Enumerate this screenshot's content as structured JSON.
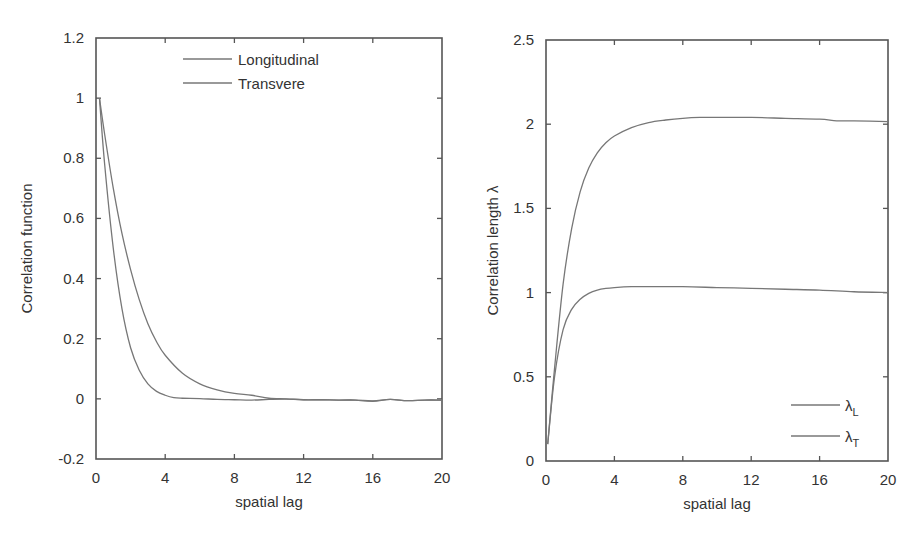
{
  "chart_data": [
    {
      "type": "line",
      "id": "left",
      "title": "",
      "xlabel": "spatial lag",
      "ylabel": "Correlation function",
      "xlim": [
        0,
        20
      ],
      "ylim": [
        -0.2,
        1.2
      ],
      "xticks": [
        0,
        4,
        8,
        12,
        16,
        20
      ],
      "yticks": [
        -0.2,
        0,
        0.2,
        0.4,
        0.6,
        0.8,
        1,
        1.2
      ],
      "ytick_labels": [
        "-0.2",
        "0",
        "0.2",
        "0.4",
        "0.6",
        "0.8",
        "1",
        "1.2"
      ],
      "grid": false,
      "legend_position": "top-center",
      "frame_px": {
        "x0": 96,
        "x1": 442,
        "y0": 38,
        "y1": 459
      },
      "series": [
        {
          "name": "Longitudinal",
          "x": [
            0.2,
            0.5,
            1,
            1.5,
            2,
            2.5,
            3,
            3.5,
            4,
            5,
            6,
            7,
            8,
            9,
            10,
            11,
            12,
            13,
            14,
            15,
            16,
            17,
            18,
            19,
            20
          ],
          "values": [
            1.0,
            0.88,
            0.7,
            0.55,
            0.43,
            0.33,
            0.25,
            0.19,
            0.145,
            0.085,
            0.05,
            0.03,
            0.018,
            0.012,
            0.002,
            0.0,
            -0.003,
            -0.003,
            -0.004,
            -0.004,
            -0.008,
            -0.002,
            -0.006,
            -0.004,
            -0.004
          ]
        },
        {
          "name": "Transvere",
          "x": [
            0.2,
            0.5,
            1,
            1.5,
            2,
            2.5,
            3,
            3.5,
            4,
            4.5,
            5,
            6,
            7,
            8,
            9,
            10,
            11,
            12,
            13,
            14,
            15,
            16,
            17,
            18,
            19,
            20
          ],
          "values": [
            1.0,
            0.78,
            0.5,
            0.3,
            0.17,
            0.095,
            0.05,
            0.025,
            0.012,
            0.004,
            0.002,
            0.001,
            -0.002,
            -0.003,
            -0.004,
            -0.002,
            -0.001,
            -0.003,
            -0.003,
            -0.004,
            -0.004,
            -0.007,
            -0.002,
            -0.006,
            -0.004,
            -0.004
          ]
        }
      ],
      "legend": {
        "entries": [
          "Longitudinal",
          "Transvere"
        ],
        "line_px": {
          "x0": 183,
          "x1": 232,
          "y": [
            59,
            83
          ]
        },
        "text_x": 238
      }
    },
    {
      "type": "line",
      "id": "right",
      "title": "",
      "xlabel": "spatial lag",
      "ylabel": "Correlation length λ",
      "xlim": [
        0,
        20
      ],
      "ylim": [
        0,
        2.5
      ],
      "xticks": [
        0,
        4,
        8,
        12,
        16,
        20
      ],
      "yticks": [
        0,
        0.5,
        1,
        1.5,
        2,
        2.5
      ],
      "ytick_labels": [
        "0",
        "0.5",
        "1",
        "1.5",
        "2",
        "2.5"
      ],
      "grid": false,
      "legend_position": "bottom-right",
      "frame_px": {
        "x0": 546,
        "x1": 888,
        "y0": 40,
        "y1": 461
      },
      "series": [
        {
          "name": "λL",
          "x": [
            0.1,
            0.5,
            1,
            1.5,
            2,
            2.5,
            3,
            3.5,
            4,
            5,
            6,
            7,
            8,
            9,
            10,
            12,
            14,
            16,
            17,
            18,
            20
          ],
          "values": [
            0.1,
            0.55,
            1.05,
            1.38,
            1.6,
            1.74,
            1.83,
            1.89,
            1.93,
            1.98,
            2.01,
            2.025,
            2.035,
            2.04,
            2.04,
            2.04,
            2.035,
            2.03,
            2.02,
            2.02,
            2.015
          ]
        },
        {
          "name": "λT",
          "x": [
            0.1,
            0.5,
            1,
            1.5,
            2,
            2.5,
            3,
            3.5,
            4,
            5,
            6,
            8,
            10,
            12,
            14,
            16,
            18,
            20
          ],
          "values": [
            0.1,
            0.5,
            0.78,
            0.9,
            0.96,
            0.995,
            1.015,
            1.025,
            1.03,
            1.035,
            1.035,
            1.035,
            1.03,
            1.025,
            1.02,
            1.015,
            1.005,
            1.0
          ]
        }
      ],
      "legend": {
        "entries": [
          "λ",
          "λ"
        ],
        "subscripts": [
          "L",
          "T"
        ],
        "line_px": {
          "x0": 791,
          "x1": 840,
          "y": [
            405,
            436
          ]
        },
        "text_x": 845
      }
    }
  ],
  "caption_fragment": "Fig. 3.  Corr..."
}
